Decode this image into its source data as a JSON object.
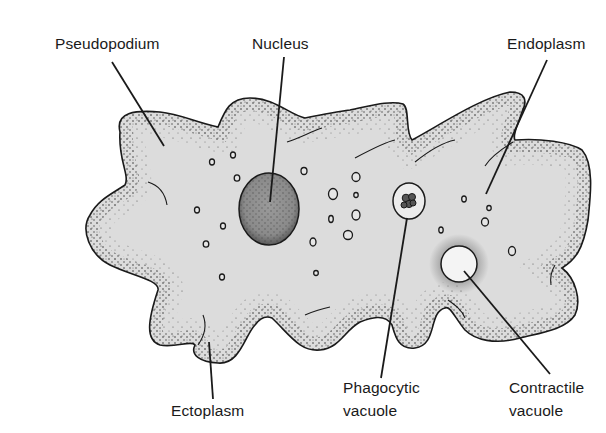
{
  "diagram": {
    "colors": {
      "cytoplasm": "#dcdcdc",
      "ectoplasm_stipple": "#3a3a3a",
      "outline": "#1a1a1a",
      "nucleus": "#8e8e8e",
      "contractile_vacuole": "#f4f4f4",
      "phagocytic_vacuole": "#ececec",
      "food_particle": "#555555",
      "background": "#ffffff"
    },
    "labels": {
      "pseudopodium": "Pseudopodium",
      "nucleus": "Nucleus",
      "endoplasm": "Endoplasm",
      "ectoplasm": "Ectoplasm",
      "phagocytic_line1": "Phagocytic",
      "phagocytic_line2": "vacuole",
      "contractile_line1": "Contractile",
      "contractile_line2": "vacuole"
    }
  }
}
